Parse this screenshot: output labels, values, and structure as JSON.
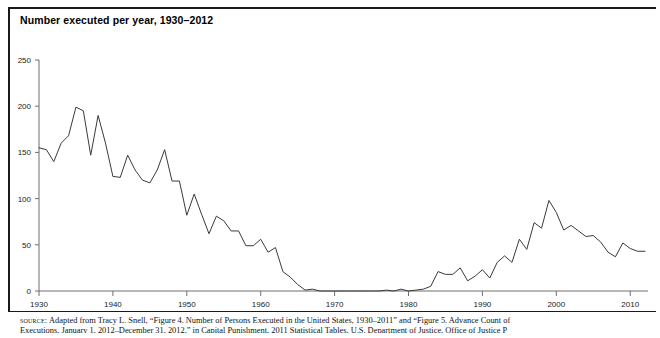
{
  "title": "Number executed per year, 1930–2012",
  "source": {
    "kicker": "source:",
    "line1": "Adapted from Tracy L. Snell, “Figure 4. Number of Persons Executed in the United States, 1930–2011” and “Figure 5. Advance Count of",
    "line2": "Executions, January 1, 2012–December 31, 2012,” in Capital Punishment, 2011 Statistical Tables, U.S. Department of Justice, Office of Justice P"
  },
  "colors": {
    "line": "#3a3a3a",
    "axis": "#6e6e6e",
    "text": "#000000",
    "background": "#ffffff",
    "frame": "#1a1a1a"
  },
  "chart_data": {
    "type": "line",
    "title": "Number executed per year, 1930–2012",
    "xlabel": "",
    "ylabel": "",
    "xlim": [
      1930,
      2012
    ],
    "ylim": [
      0,
      250
    ],
    "grid": false,
    "legend": "none",
    "ytick_labels": [
      "0",
      "50",
      "100",
      "150",
      "200",
      "250"
    ],
    "ytick_values": [
      0,
      50,
      100,
      150,
      200,
      250
    ],
    "xtick_labels": [
      "1930",
      "1940",
      "1950",
      "1960",
      "1970",
      "1980",
      "1990",
      "2000",
      "2010"
    ],
    "xtick_values": [
      1930,
      1940,
      1950,
      1960,
      1970,
      1980,
      1990,
      2000,
      2010
    ],
    "series": [
      {
        "name": "Number executed per year",
        "x": [
          1930,
          1931,
          1932,
          1933,
          1934,
          1935,
          1936,
          1937,
          1938,
          1939,
          1940,
          1941,
          1942,
          1943,
          1944,
          1945,
          1946,
          1947,
          1948,
          1949,
          1950,
          1951,
          1952,
          1953,
          1954,
          1955,
          1956,
          1957,
          1958,
          1959,
          1960,
          1961,
          1962,
          1963,
          1964,
          1965,
          1966,
          1967,
          1968,
          1969,
          1970,
          1971,
          1972,
          1973,
          1974,
          1975,
          1976,
          1977,
          1978,
          1979,
          1980,
          1981,
          1982,
          1983,
          1984,
          1985,
          1986,
          1987,
          1988,
          1989,
          1990,
          1991,
          1992,
          1993,
          1994,
          1995,
          1996,
          1997,
          1998,
          1999,
          2000,
          2001,
          2002,
          2003,
          2004,
          2005,
          2006,
          2007,
          2008,
          2009,
          2010,
          2011,
          2012
        ],
        "values": [
          155,
          153,
          140,
          160,
          168,
          199,
          195,
          147,
          190,
          160,
          124,
          123,
          147,
          131,
          120,
          117,
          131,
          153,
          119,
          119,
          82,
          105,
          83,
          62,
          81,
          76,
          65,
          65,
          49,
          49,
          56,
          42,
          47,
          21,
          15,
          7,
          1,
          2,
          0,
          0,
          0,
          0,
          0,
          0,
          0,
          0,
          0,
          1,
          0,
          2,
          0,
          1,
          2,
          5,
          21,
          18,
          18,
          25,
          11,
          16,
          23,
          14,
          31,
          38,
          31,
          56,
          45,
          74,
          68,
          98,
          85,
          66,
          71,
          65,
          59,
          60,
          53,
          42,
          37,
          52,
          46,
          43,
          43
        ]
      }
    ]
  }
}
